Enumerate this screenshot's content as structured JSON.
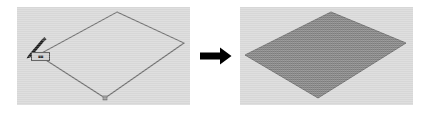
{
  "figure": {
    "caption": "",
    "background_color": "#ffffff",
    "width": 428,
    "height": 113
  },
  "transition": {
    "arrow_icon": "right-arrow-icon",
    "arrow_color": "#000000",
    "direction": "right"
  },
  "panels": [
    {
      "id": "before",
      "role": "before",
      "viewport_color": "#d9d9d9",
      "shape": {
        "name": "parallelogram-outline",
        "state": "unfilled",
        "outline_color": "#6e6e6e",
        "fill_color": "none",
        "vertices": [
          {
            "label": "top",
            "x": 100,
            "y": 5
          },
          {
            "label": "right",
            "x": 167,
            "y": 36
          },
          {
            "label": "bottom",
            "x": 88,
            "y": 91
          },
          {
            "label": "left",
            "x": 21,
            "y": 48
          }
        ],
        "vertex_markers": [
          {
            "label": "bottom",
            "x": 88,
            "y": 91
          }
        ]
      },
      "cursor": {
        "icon": "pen-cursor-icon",
        "color": "#1c1c1c",
        "x": 21,
        "y": 48
      },
      "tooltip": {
        "text": "■■",
        "background_color": "#cfcfcf",
        "border_color": "#4a4a4a",
        "x": 14,
        "y": 45
      }
    },
    {
      "id": "after",
      "role": "after",
      "viewport_color": "#d9d9d9",
      "shape": {
        "name": "parallelogram-filled",
        "state": "filled",
        "outline_color": "#6e6e6e",
        "fill_color": "#808080",
        "fill_pattern": "dither-halftone",
        "vertices": [
          {
            "label": "top",
            "x": 91,
            "y": 5
          },
          {
            "label": "right",
            "x": 166,
            "y": 36
          },
          {
            "label": "bottom",
            "x": 78,
            "y": 91
          },
          {
            "label": "left",
            "x": 5,
            "y": 48
          }
        ],
        "vertex_markers": []
      },
      "cursor": null,
      "tooltip": null
    }
  ]
}
